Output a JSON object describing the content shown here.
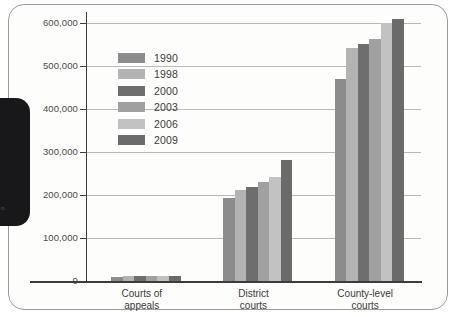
{
  "frame": {
    "marginal_note": "n."
  },
  "chart_data": {
    "type": "bar",
    "title": "",
    "xlabel": "",
    "ylabel": "",
    "categories": [
      "Courts of\nappeals",
      "District\ncourts",
      "County-level\ncourts"
    ],
    "ylim": [
      0,
      620000
    ],
    "yticks": [
      0,
      100000,
      200000,
      300000,
      400000,
      500000,
      600000
    ],
    "ytick_labels": [
      "0",
      "100,000",
      "200,000",
      "300,000",
      "400,000",
      "500,000",
      "600,000"
    ],
    "grid": true,
    "legend_position": "upper-center-left",
    "series": [
      {
        "name": "1990",
        "color": "#8c8c8c",
        "values": [
          10000,
          192000,
          470000
        ]
      },
      {
        "name": "1998",
        "color": "#b3b3b3",
        "values": [
          10500,
          211000,
          540000
        ]
      },
      {
        "name": "2000",
        "color": "#6e6e6e",
        "values": [
          11000,
          218000,
          551000
        ]
      },
      {
        "name": "2003",
        "color": "#a0a0a0",
        "values": [
          11500,
          229000,
          563000
        ]
      },
      {
        "name": "2006",
        "color": "#c2c2c2",
        "values": [
          11500,
          241000,
          600000
        ]
      },
      {
        "name": "2009",
        "color": "#6b6b6b",
        "values": [
          11500,
          280000,
          609000
        ]
      }
    ]
  },
  "legend": {
    "items": [
      {
        "label": "1990",
        "color": "#8c8c8c"
      },
      {
        "label": "1998",
        "color": "#b3b3b3"
      },
      {
        "label": "2000",
        "color": "#6e6e6e"
      },
      {
        "label": "2003",
        "color": "#a0a0a0"
      },
      {
        "label": "2006",
        "color": "#c2c2c2"
      },
      {
        "label": "2009",
        "color": "#6b6b6b"
      }
    ]
  }
}
